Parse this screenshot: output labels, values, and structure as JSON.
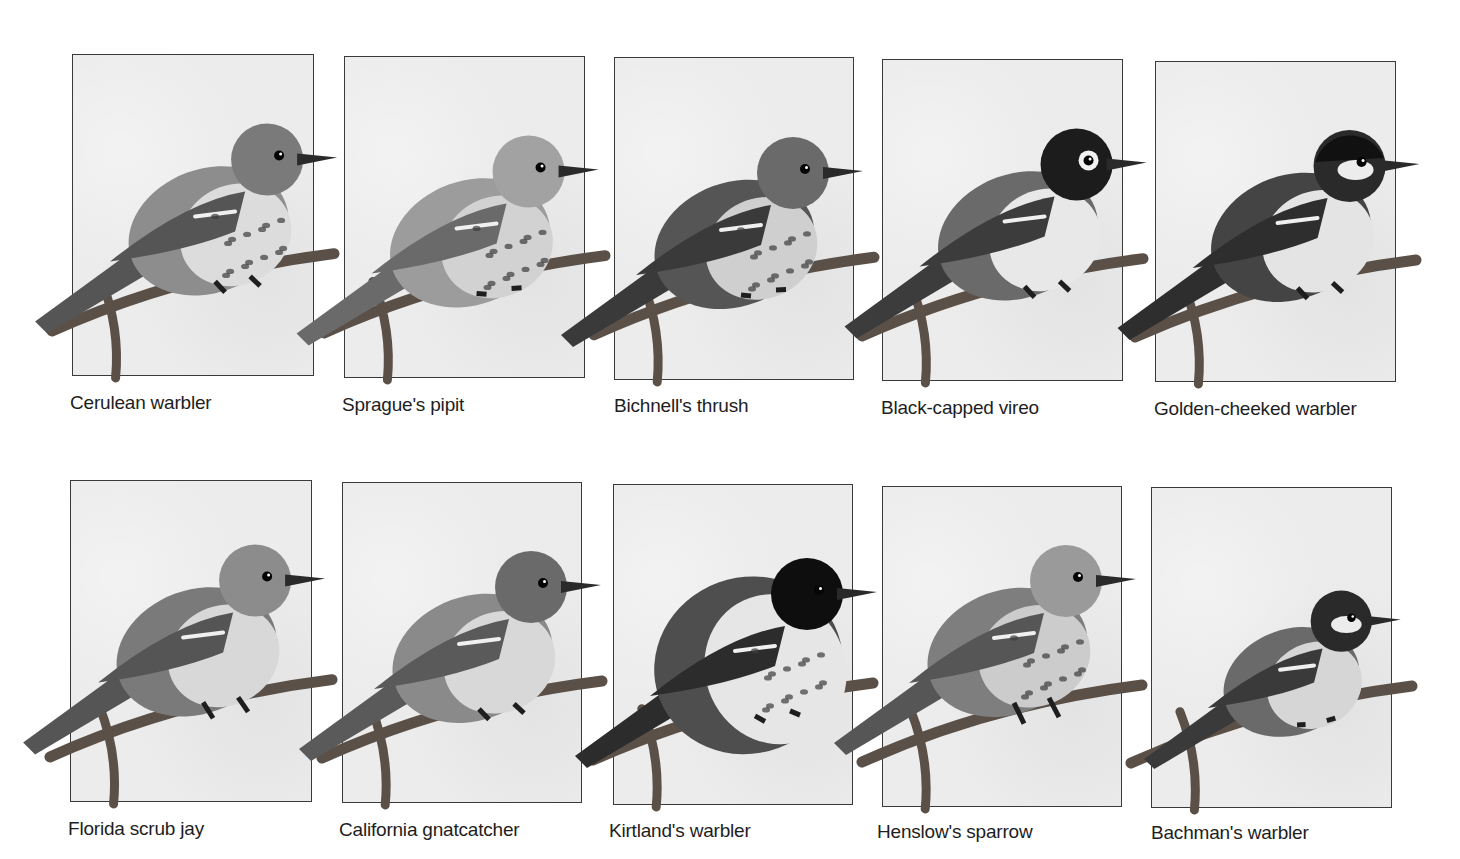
{
  "figure": {
    "rows": [
      {
        "birds": [
          {
            "name": "Cerulean warbler",
            "panel": {
              "x": 72,
              "y": 54,
              "w": 242,
              "h": 322
            },
            "caption_pos": {
              "x": 70,
              "y": 392
            },
            "style": "warbler-light"
          },
          {
            "name": "Sprague's pipit",
            "panel": {
              "x": 344,
              "y": 56,
              "w": 241,
              "h": 322
            },
            "caption_pos": {
              "x": 342,
              "y": 394
            },
            "style": "pipit"
          },
          {
            "name": "Bichnell's thrush",
            "panel": {
              "x": 614,
              "y": 57,
              "w": 240,
              "h": 323
            },
            "caption_pos": {
              "x": 614,
              "y": 395
            },
            "style": "thrush"
          },
          {
            "name": "Black-capped vireo",
            "panel": {
              "x": 882,
              "y": 59,
              "w": 241,
              "h": 322
            },
            "caption_pos": {
              "x": 881,
              "y": 397
            },
            "style": "vireo"
          },
          {
            "name": "Golden-cheeked warbler",
            "panel": {
              "x": 1155,
              "y": 61,
              "w": 241,
              "h": 321
            },
            "caption_pos": {
              "x": 1154,
              "y": 398
            },
            "style": "golden"
          }
        ]
      },
      {
        "birds": [
          {
            "name": "Florida scrub jay",
            "panel": {
              "x": 70,
              "y": 480,
              "w": 242,
              "h": 322
            },
            "caption_pos": {
              "x": 68,
              "y": 818
            },
            "style": "jay"
          },
          {
            "name": "California gnatcatcher",
            "panel": {
              "x": 342,
              "y": 482,
              "w": 240,
              "h": 321
            },
            "caption_pos": {
              "x": 339,
              "y": 819
            },
            "style": "gnatcatcher"
          },
          {
            "name": "Kirtland's warbler",
            "panel": {
              "x": 613,
              "y": 484,
              "w": 240,
              "h": 321
            },
            "caption_pos": {
              "x": 609,
              "y": 820
            },
            "style": "kirtland"
          },
          {
            "name": "Henslow's sparrow",
            "panel": {
              "x": 882,
              "y": 486,
              "w": 240,
              "h": 321
            },
            "caption_pos": {
              "x": 877,
              "y": 821
            },
            "style": "sparrow"
          },
          {
            "name": "Bachman's warbler",
            "panel": {
              "x": 1151,
              "y": 487,
              "w": 241,
              "h": 321
            },
            "caption_pos": {
              "x": 1151,
              "y": 822
            },
            "style": "bachman"
          }
        ]
      }
    ]
  },
  "colors": {
    "panel_border": "#3a3a3a",
    "panel_bg": "#ececec",
    "caption_text": "#1e1e1e"
  }
}
